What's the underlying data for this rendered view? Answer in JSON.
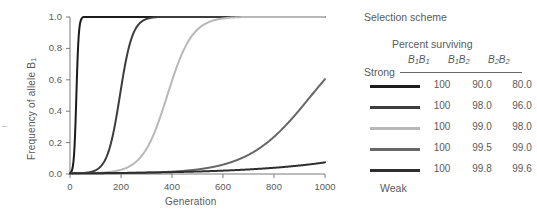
{
  "chart_data": {
    "type": "line",
    "title": "",
    "xlabel": "Generation",
    "ylabel": "Frequency of allele B1",
    "ylabel_base": "Frequency of allele B",
    "ylabel_sub": "1",
    "xlim": [
      0,
      1000
    ],
    "ylim": [
      0.0,
      1.0
    ],
    "grid": false,
    "legend_position": "right",
    "xticks": [
      0,
      200,
      400,
      600,
      800,
      1000
    ],
    "xticklabels": [
      "0",
      "200",
      "400",
      "600",
      "800",
      "1000"
    ],
    "yticks": [
      0.0,
      0.2,
      0.4,
      0.6,
      0.8,
      1.0
    ],
    "yticklabels": [
      "0.0",
      "0.2",
      "0.4",
      "0.6",
      "0.8",
      "1.0"
    ],
    "series": [
      {
        "name": "strong-selection",
        "color": "#1c1c1c",
        "midpoint_generation": 25,
        "rate": 0.215,
        "end_value": 1.0,
        "x": [
          0,
          10,
          20,
          25,
          30,
          40,
          50,
          60,
          80,
          100,
          150,
          200,
          400,
          600,
          800,
          1000
        ],
        "y": [
          0.01,
          0.08,
          0.34,
          0.5,
          0.66,
          0.86,
          0.945,
          0.978,
          0.997,
          1.0,
          1.0,
          1.0,
          1.0,
          1.0,
          1.0,
          1.0
        ]
      },
      {
        "name": "second-selection",
        "color": "#3d3d3d",
        "midpoint_generation": 196,
        "rate": 0.0405,
        "end_value": 1.0,
        "x": [
          0,
          50,
          100,
          140,
          170,
          196,
          220,
          250,
          300,
          350,
          400,
          500,
          700,
          1000
        ],
        "y": [
          0.01,
          0.07,
          0.26,
          0.41,
          0.47,
          0.5,
          0.62,
          0.76,
          0.915,
          0.97,
          0.99,
          0.999,
          1.0,
          1.0
        ]
      },
      {
        "name": "third-selection",
        "color": "#b8b8b8",
        "midpoint_generation": 382,
        "rate": 0.0205,
        "end_value": 1.0,
        "x": [
          0,
          100,
          200,
          300,
          382,
          450,
          500,
          600,
          700,
          800,
          900,
          1000
        ],
        "y": [
          0.004,
          0.02,
          0.12,
          0.31,
          0.5,
          0.66,
          0.76,
          0.9,
          0.96,
          0.985,
          0.995,
          0.999
        ]
      },
      {
        "name": "fourth-selection",
        "color": "#676767",
        "midpoint_generation": 940,
        "rate": 0.0082,
        "end_value": 0.6,
        "x": [
          0,
          100,
          200,
          300,
          400,
          500,
          600,
          700,
          800,
          900,
          1000
        ],
        "y": [
          0.003,
          0.008,
          0.017,
          0.035,
          0.07,
          0.125,
          0.2,
          0.3,
          0.4,
          0.5,
          0.6
        ]
      },
      {
        "name": "weak-selection",
        "color": "#2e2e2e",
        "midpoint_generation": 2600,
        "rate": 0.0032,
        "end_value": 0.07,
        "x": [
          0,
          100,
          200,
          300,
          400,
          500,
          600,
          700,
          800,
          900,
          1000
        ],
        "y": [
          0.003,
          0.006,
          0.01,
          0.015,
          0.021,
          0.028,
          0.036,
          0.045,
          0.055,
          0.062,
          0.07
        ]
      }
    ]
  },
  "legend": {
    "title": "Selection scheme",
    "subtitle": "Percent surviving",
    "strong_label": "Strong",
    "weak_label": "Weak",
    "genotype_headers": [
      {
        "base": "B",
        "sub1": "1",
        "base2": "B",
        "sub2": "1",
        "text": "B1B1"
      },
      {
        "base": "B",
        "sub1": "1",
        "base2": "B",
        "sub2": "2",
        "text": "B1B2"
      },
      {
        "base": "B",
        "sub1": "2",
        "base2": "B",
        "sub2": "2",
        "text": "B2B2"
      }
    ],
    "rows": [
      {
        "color": "#1c1c1c",
        "values": [
          "100",
          "90.0",
          "80.0"
        ]
      },
      {
        "color": "#3d3d3d",
        "values": [
          "100",
          "98.0",
          "96.0"
        ]
      },
      {
        "color": "#b8b8b8",
        "values": [
          "100",
          "99.0",
          "98.0"
        ]
      },
      {
        "color": "#676767",
        "values": [
          "100",
          "99.5",
          "99.0"
        ]
      },
      {
        "color": "#2e2e2e",
        "values": [
          "100",
          "99.8",
          "99.6"
        ]
      }
    ]
  },
  "colors": {
    "axis": "#7a7a7a",
    "text": "#5a5a5a",
    "background": "#ffffff"
  }
}
